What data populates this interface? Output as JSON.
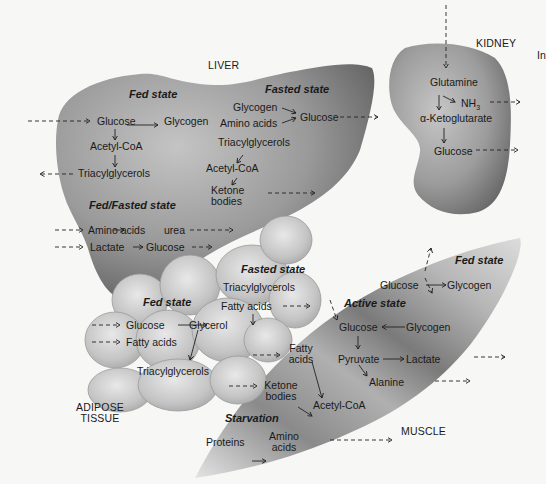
{
  "organs": {
    "liver": "LIVER",
    "kidney": "KIDNEY",
    "kidney_cut": "In",
    "adipose_line1": "ADIPOSE",
    "adipose_line2": "TISSUE",
    "muscle": "MUSCLE"
  },
  "liver": {
    "fed": {
      "heading": "Fed state",
      "glucose": "Glucose",
      "glycogen": "Glycogen",
      "acetylcoa": "Acetyl-CoA",
      "tag": "Triacylglycerols"
    },
    "fasted": {
      "heading": "Fasted state",
      "glycogen": "Glycogen",
      "amino_acids": "Amino acids",
      "glucose": "Glucose",
      "tag": "Triacylglycerols",
      "acetylcoa": "Acetyl-CoA",
      "ketone1": "Ketone",
      "ketone2": "bodies"
    },
    "fedfasted": {
      "heading": "Fed/Fasted state",
      "amino_acids": "Amino acids",
      "urea": "urea",
      "lactate": "Lactate",
      "glucose": "Glucose"
    }
  },
  "kidney": {
    "glutamine": "Glutamine",
    "nh3": "NH",
    "nh3_sub": "3",
    "akg": "α-Ketoglutarate",
    "glucose": "Glucose"
  },
  "adipose": {
    "fed": {
      "heading": "Fed state",
      "glucose": "Glucose",
      "glycerol": "Glycerol",
      "fatty_acids": "Fatty acids",
      "tag": "Triacylglycerols"
    },
    "fasted": {
      "heading": "Fasted state",
      "tag": "Triacylglycerols",
      "fatty_acids": "Fatty acids"
    }
  },
  "muscle": {
    "fed": {
      "heading": "Fed state",
      "glucose": "Glucose",
      "glycogen": "Glycogen"
    },
    "active": {
      "heading": "Active state",
      "glucose": "Glucose",
      "glycogen": "Glycogen",
      "pyruvate": "Pyruvate",
      "lactate": "Lactate",
      "alanine": "Alanine"
    },
    "inputs": {
      "fatty1": "Fatty",
      "fatty2": "acids",
      "ketone1": "Ketone",
      "ketone2": "bodies",
      "acetylcoa": "Acetyl-CoA"
    },
    "starvation": {
      "heading": "Starvation",
      "proteins": "Proteins",
      "amino1": "Amino",
      "amino2": "acids"
    }
  },
  "colors": {
    "background": "#f7f7f5",
    "organ_dark": "#6e6e6e",
    "organ_light": "#b8b8b8",
    "fat_cell": "#c9c9c9",
    "text": "#1a1a1a"
  }
}
